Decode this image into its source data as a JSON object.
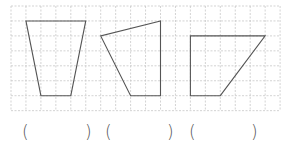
{
  "grid": {
    "origin_x": 11,
    "origin_y": 6,
    "cell": 14.95,
    "cols": 18,
    "rows": 7,
    "line_color": "#c8c8c8",
    "dash": "2,1.5"
  },
  "shapes": [
    {
      "name": "trapezoid-shape",
      "points": [
        [
          1,
          1
        ],
        [
          5,
          1
        ],
        [
          4,
          6
        ],
        [
          2,
          6
        ]
      ]
    },
    {
      "name": "right-trapezoid-shape-2",
      "points": [
        [
          10,
          1
        ],
        [
          6,
          2
        ],
        [
          8,
          6
        ],
        [
          10,
          6
        ]
      ]
    },
    {
      "name": "right-trapezoid-shape-3",
      "points": [
        [
          12,
          2
        ],
        [
          17,
          2
        ],
        [
          14,
          6
        ],
        [
          12,
          6
        ]
      ]
    }
  ],
  "shape_stroke": "#555555",
  "answers": [
    {
      "open": "(",
      "close": ")",
      "value": ""
    },
    {
      "open": "(",
      "close": ")",
      "value": ""
    },
    {
      "open": "(",
      "close": ")",
      "value": ""
    }
  ]
}
